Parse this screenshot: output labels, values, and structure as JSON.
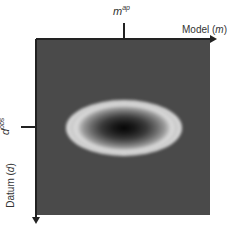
{
  "diagram": {
    "x_axis": {
      "label": "Model (",
      "symbol": "m",
      "label_close": ")",
      "tick": {
        "base": "m",
        "superscript": "ap"
      }
    },
    "y_axis": {
      "label": "Datum (",
      "symbol": "d",
      "label_close": ")",
      "tick": {
        "base": "d",
        "superscript": "obs"
      }
    },
    "colors": {
      "background": "#4a4a4a",
      "ring": "#e0e0e0",
      "center": "#050505",
      "axis": "#222222"
    }
  }
}
